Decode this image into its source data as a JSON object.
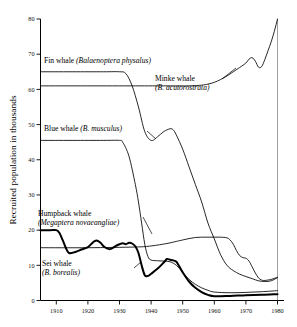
{
  "chart_data": {
    "type": "line",
    "title": "",
    "xlabel": "",
    "ylabel": "Recruited population in thousands",
    "xlim": [
      1905,
      1980
    ],
    "ylim": [
      0,
      80
    ],
    "xticks": [
      1910,
      1920,
      1930,
      1940,
      1950,
      1960,
      1970,
      1980
    ],
    "yticks": [
      0,
      10,
      20,
      30,
      40,
      50,
      60,
      70,
      80
    ],
    "grid": false,
    "legend_position": "inline-annotations",
    "series": [
      {
        "name": "Fin whale",
        "scientific_name": "Balaenoptera physalus",
        "label": "Fin whale (Balaenoptera physalus)",
        "line_weight": "thin",
        "x": [
          1905,
          1915,
          1925,
          1930,
          1932,
          1934,
          1936,
          1938,
          1940,
          1942,
          1944,
          1946,
          1947,
          1948,
          1950,
          1952,
          1954,
          1956,
          1958,
          1960,
          1962,
          1964,
          1966,
          1968,
          1970,
          1972,
          1974,
          1976,
          1978,
          1980
        ],
        "y": [
          65,
          65,
          65,
          65,
          64.5,
          61,
          55,
          48,
          45.5,
          46.5,
          48,
          48.8,
          48.5,
          47,
          43,
          38,
          33,
          28,
          22,
          17.5,
          13,
          10,
          8.5,
          7.5,
          6.8,
          6.2,
          5.6,
          5.4,
          5.6,
          6.5
        ]
      },
      {
        "name": "Minke whale",
        "scientific_name": "B. acutorostrata",
        "label": "Minke whale (B. acutorostrata)",
        "line_weight": "thin",
        "x": [
          1905,
          1920,
          1935,
          1945,
          1952,
          1956,
          1958,
          1960,
          1962,
          1964,
          1966,
          1968,
          1970,
          1971,
          1972,
          1973,
          1974,
          1975,
          1976,
          1977,
          1978,
          1979,
          1980
        ],
        "y": [
          61,
          61,
          61,
          61,
          61,
          61.2,
          61.5,
          62,
          62.8,
          63.8,
          65,
          66.2,
          67.5,
          68.6,
          69,
          68,
          66.3,
          66.5,
          68.5,
          71,
          73.5,
          76.5,
          80
        ]
      },
      {
        "name": "Blue whale",
        "scientific_name": "B. musculus",
        "label": "Blue whale (B. musculus)",
        "line_weight": "thin",
        "x": [
          1905,
          1915,
          1925,
          1930,
          1931,
          1933,
          1935,
          1936,
          1937,
          1938,
          1939,
          1940,
          1942,
          1944,
          1946,
          1948,
          1950,
          1952,
          1954,
          1956,
          1958,
          1960,
          1965,
          1970,
          1975,
          1980
        ],
        "y": [
          45.5,
          45.5,
          45.5,
          45.5,
          45,
          41,
          33,
          28,
          22,
          16,
          12.5,
          11.5,
          11.3,
          11.2,
          11,
          10,
          8,
          6,
          4.6,
          3.6,
          2.9,
          2.4,
          2.2,
          2.3,
          2.5,
          2.8
        ]
      },
      {
        "name": "Sei whale",
        "scientific_name": "B. borealis",
        "label": "Sei whale (B. borealis)",
        "line_weight": "thin",
        "x": [
          1905,
          1920,
          1935,
          1940,
          1945,
          1948,
          1950,
          1952,
          1954,
          1956,
          1958,
          1960,
          1962,
          1964,
          1965,
          1966,
          1967,
          1968,
          1969,
          1970,
          1971,
          1972,
          1973,
          1974,
          1975,
          1976,
          1978,
          1980
        ],
        "y": [
          15,
          15,
          15.2,
          15.5,
          16.2,
          16.8,
          17.2,
          17.6,
          17.9,
          18,
          18,
          18,
          18,
          17.8,
          17.2,
          16,
          14.2,
          12.8,
          12.2,
          12,
          11.2,
          9.5,
          7.8,
          6.4,
          5.8,
          5.7,
          6,
          6.6
        ]
      },
      {
        "name": "Humpback whale",
        "scientific_name": "Megaptera novaeangliae",
        "label": "Humpback whale (Megaptera novaeangliae)",
        "line_weight": "thick",
        "x": [
          1905,
          1908,
          1910,
          1911,
          1912,
          1913,
          1914,
          1916,
          1918,
          1920,
          1921,
          1922,
          1923,
          1924,
          1925,
          1926,
          1927,
          1928,
          1929,
          1930,
          1931,
          1932,
          1933,
          1934,
          1935,
          1936,
          1937,
          1938,
          1939,
          1940,
          1942,
          1944,
          1945,
          1946,
          1947,
          1948,
          1949,
          1950,
          1952,
          1954,
          1956,
          1958,
          1960,
          1965,
          1970,
          1975,
          1980
        ],
        "y": [
          20,
          20,
          20,
          19.2,
          17.2,
          15,
          13.5,
          13.8,
          14.5,
          15.2,
          16,
          16.8,
          17,
          16.4,
          15.4,
          14.8,
          14.6,
          15,
          15.6,
          16,
          16.3,
          16,
          16.4,
          16.2,
          15.4,
          13.5,
          10,
          7.2,
          7,
          7.6,
          9,
          10.8,
          11.8,
          11.6,
          11.4,
          11,
          9.6,
          8,
          5.4,
          3.6,
          2.4,
          1.6,
          1.2,
          1.3,
          1.5,
          1.6,
          1.8
        ]
      }
    ]
  },
  "axis": {
    "ylabel": "Recruited population in thousands",
    "xtick_labels": [
      "1910",
      "1920",
      "1930",
      "1940",
      "1950",
      "1960",
      "1970",
      "1980"
    ],
    "ytick_labels": [
      "0",
      "10",
      "20",
      "30",
      "40",
      "50",
      "60",
      "70",
      "80"
    ]
  },
  "annotations": {
    "fin": {
      "common": "Fin whale",
      "sci": "(Balaenoptera physalus)"
    },
    "minke": {
      "common": "Minke whale",
      "sci": "(B. acutorostrata)"
    },
    "blue": {
      "common": "Blue whale",
      "sci": "(B. musculus)"
    },
    "humpback": {
      "common": "Humpback whale",
      "sci": "(Megaptera novaeangliae)"
    },
    "sei": {
      "common": "Sei whale",
      "sci": "(B. borealis)"
    }
  },
  "colors": {
    "line": "#000000",
    "axis": "#000000",
    "background": "#ffffff"
  }
}
